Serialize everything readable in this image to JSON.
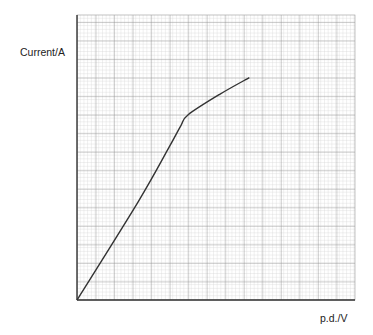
{
  "chart_data": {
    "type": "line",
    "title": "",
    "xlabel": "p.d./V",
    "ylabel": "Current/A",
    "grid": true,
    "legend": null,
    "x_ticks": [],
    "y_ticks": [],
    "units_note": "values in grid units (major squares) from origin",
    "series": [
      {
        "name": "I-V curve",
        "points": [
          [
            0,
            0
          ],
          [
            3.3,
            5.3
          ],
          [
            5.0,
            8.3
          ],
          [
            5.6,
            9.4
          ],
          [
            6.0,
            10.0
          ],
          [
            7.7,
            11.1
          ],
          [
            9.3,
            12.0
          ]
        ]
      }
    ],
    "xlim": [
      0,
      15
    ],
    "ylim": [
      0,
      15.4
    ]
  },
  "labels": {
    "y_axis": "Current/A",
    "x_axis": "p.d./V"
  }
}
